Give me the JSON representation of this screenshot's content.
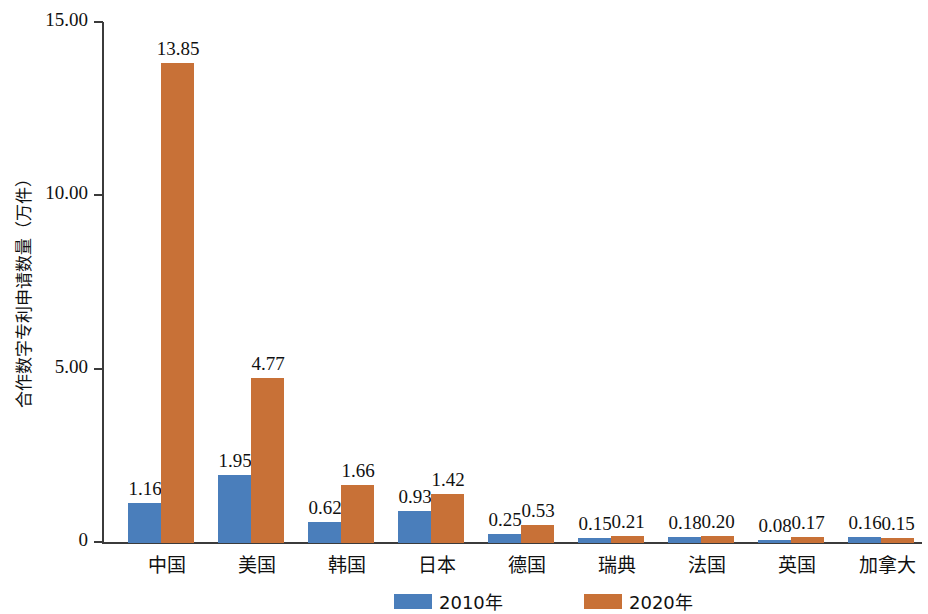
{
  "chart_data": {
    "type": "bar",
    "title": "",
    "xlabel": "",
    "ylabel": "合作数字专利申请数量（万件）",
    "ylim": [
      0,
      15
    ],
    "yticks": [
      "0",
      "5.00",
      "10.00",
      "15.00"
    ],
    "ytick_values": [
      0,
      5,
      10,
      15
    ],
    "grid": false,
    "legend_position": "bottom",
    "categories": [
      "中国",
      "美国",
      "韩国",
      "日本",
      "德国",
      "瑞典",
      "法国",
      "英国",
      "加拿大"
    ],
    "series": [
      {
        "name": "2010年",
        "color": "#4a7ebb",
        "values": [
          1.16,
          1.95,
          0.62,
          0.93,
          0.25,
          0.15,
          0.18,
          0.08,
          0.16
        ],
        "labels": [
          "1.16",
          "1.95",
          "0.62",
          "0.93",
          "0.25",
          "0.15",
          "0.18",
          "0.08",
          "0.16"
        ]
      },
      {
        "name": "2020年",
        "color": "#c87137",
        "values": [
          13.85,
          4.77,
          1.66,
          1.42,
          0.53,
          0.21,
          0.2,
          0.17,
          0.15
        ],
        "labels": [
          "13.85",
          "4.77",
          "1.66",
          "1.42",
          "0.53",
          "0.21",
          "0.20",
          "0.17",
          "0.15"
        ]
      }
    ]
  },
  "legend": {
    "items": [
      {
        "label": "2010年",
        "color": "#4a7ebb"
      },
      {
        "label": "2020年",
        "color": "#c87137"
      }
    ]
  }
}
